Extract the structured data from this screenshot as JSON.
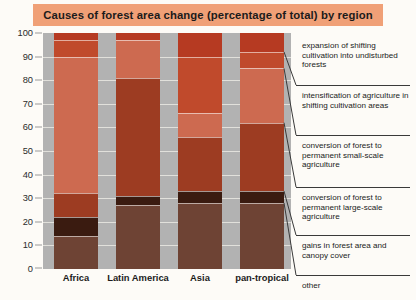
{
  "header": {
    "title": "Causes of forest area change (percentage of total) by region",
    "banner_color": "#f0a077"
  },
  "chart_data": {
    "type": "bar",
    "stacked": true,
    "title": "Causes of forest area change (percentage of total) by region",
    "xlabel": "",
    "ylabel": "",
    "ylim": [
      0,
      100
    ],
    "yticks": [
      0,
      10,
      20,
      30,
      40,
      50,
      60,
      70,
      80,
      90,
      100
    ],
    "grid": true,
    "legend_position": "right",
    "categories": [
      "Africa",
      "Latin America",
      "Asia",
      "pan-tropical"
    ],
    "series": [
      {
        "name": "expansion of shifting cultivation into undisturbed forests",
        "color": "#b63a22",
        "values": [
          3,
          3,
          10,
          8
        ]
      },
      {
        "name": "intensification of agriculture in shifting cultivation areas",
        "color": "#c04a2c",
        "values": [
          7,
          0,
          24,
          7
        ]
      },
      {
        "name": "conversion of forest to permanent small-scale agriculture",
        "color": "#cd6a50",
        "values": [
          58,
          16,
          10,
          23
        ]
      },
      {
        "name": "conversion of forest to permanent large-scale agriculture",
        "color": "#9d3c22",
        "values": [
          10,
          50,
          23,
          29
        ]
      },
      {
        "name": "gains in forest area and canopy cover",
        "color": "#3a1b10",
        "values": [
          8,
          4,
          5,
          5
        ]
      },
      {
        "name": "other",
        "color": "#6e4334",
        "values": [
          14,
          27,
          28,
          28
        ]
      }
    ],
    "plot_background": "#b2b2b2"
  },
  "legend": {
    "items": [
      {
        "label": "expansion of shifting cultivation into undisturbed forests"
      },
      {
        "label": "intensification of agriculture in shifting cultivation areas"
      },
      {
        "label": "conversion of forest to permanent small-scale agriculture"
      },
      {
        "label": "conversion of forest to permanent large-scale agriculture"
      },
      {
        "label": "gains in forest area and canopy cover"
      },
      {
        "label": "other"
      }
    ]
  },
  "axis": {
    "ticks": [
      "100",
      "90",
      "80",
      "70",
      "60",
      "50",
      "40",
      "30",
      "20",
      "10",
      "0"
    ]
  }
}
